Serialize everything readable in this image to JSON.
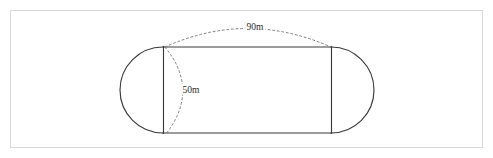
{
  "figure": {
    "background_color": "#ffffff",
    "frame_border_color": "#d8d8d8",
    "stroke_color": "#3a3a3a",
    "dashed_color": "#707070"
  },
  "shape": {
    "name": "stadium",
    "description": "Rectangle with semicircular ends",
    "rect_left_x": 163,
    "rect_right_x": 331,
    "rect_top_y": 47,
    "rect_bottom_y": 133,
    "left_cap_extent_x": 122,
    "right_cap_extent_x": 373
  },
  "dimensions": [
    {
      "id": "length",
      "label": "90m",
      "value": 90,
      "unit": "m",
      "orientation": "horizontal",
      "label_x": 255,
      "label_y": 30
    },
    {
      "id": "width",
      "label": "50m",
      "value": 50,
      "unit": "m",
      "orientation": "vertical",
      "label_x": 191,
      "label_y": 93
    }
  ]
}
